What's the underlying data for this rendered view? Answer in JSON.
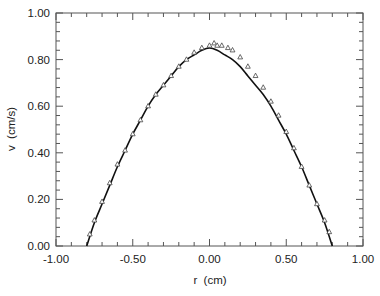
{
  "chart_data": {
    "type": "line",
    "title": "",
    "xlabel": "r  (cm)",
    "ylabel": "v  (cm/s)",
    "xlim": [
      -1.0,
      1.0
    ],
    "ylim": [
      0.0,
      1.0
    ],
    "grid": false,
    "legend": null,
    "x_ticks": [
      "-1.00",
      "-0.50",
      "0.00",
      "0.50",
      "1.00"
    ],
    "y_ticks": [
      "0.00",
      "0.20",
      "0.40",
      "0.60",
      "0.80",
      "1.00"
    ],
    "series": [
      {
        "name": "model curve",
        "style": "solid-line",
        "color": "#111111",
        "x": [
          -0.8,
          -0.75,
          -0.7,
          -0.65,
          -0.6,
          -0.55,
          -0.5,
          -0.45,
          -0.4,
          -0.35,
          -0.3,
          -0.25,
          -0.2,
          -0.15,
          -0.1,
          -0.05,
          0.0,
          0.05,
          0.1,
          0.15,
          0.2,
          0.25,
          0.3,
          0.35,
          0.4,
          0.45,
          0.5,
          0.55,
          0.6,
          0.65,
          0.7,
          0.75,
          0.8
        ],
        "values": [
          0.0,
          0.1,
          0.18,
          0.26,
          0.34,
          0.41,
          0.48,
          0.54,
          0.6,
          0.65,
          0.69,
          0.73,
          0.77,
          0.8,
          0.82,
          0.84,
          0.85,
          0.84,
          0.82,
          0.8,
          0.77,
          0.73,
          0.69,
          0.65,
          0.6,
          0.54,
          0.48,
          0.41,
          0.34,
          0.26,
          0.18,
          0.1,
          0.0
        ]
      },
      {
        "name": "measured data",
        "style": "open-triangle-markers",
        "color": "#333333",
        "x": [
          -0.78,
          -0.75,
          -0.7,
          -0.65,
          -0.6,
          -0.55,
          -0.5,
          -0.45,
          -0.4,
          -0.35,
          -0.3,
          -0.25,
          -0.2,
          -0.15,
          -0.1,
          -0.05,
          0.0,
          0.03,
          0.05,
          0.08,
          0.12,
          0.15,
          0.2,
          0.25,
          0.3,
          0.35,
          0.4,
          0.45,
          0.5,
          0.55,
          0.6,
          0.65,
          0.7,
          0.75,
          0.78
        ],
        "values": [
          0.04,
          0.1,
          0.18,
          0.26,
          0.34,
          0.4,
          0.47,
          0.53,
          0.59,
          0.64,
          0.68,
          0.72,
          0.76,
          0.79,
          0.82,
          0.84,
          0.85,
          0.86,
          0.85,
          0.85,
          0.84,
          0.83,
          0.8,
          0.76,
          0.72,
          0.67,
          0.61,
          0.55,
          0.48,
          0.41,
          0.33,
          0.25,
          0.17,
          0.1,
          0.05
        ]
      }
    ]
  }
}
